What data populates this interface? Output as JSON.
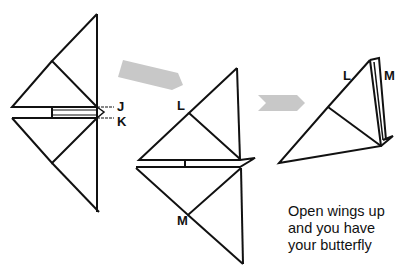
{
  "diagram": {
    "type": "origami-instruction",
    "subject": "butterfly",
    "steps": [
      {
        "id": "step-1",
        "labels": [
          "J",
          "K"
        ],
        "description": "Diamond with horizontal fold strip at center; creases J and K"
      },
      {
        "id": "step-2",
        "labels": [
          "L",
          "M"
        ],
        "description": "Folded along J/K; points L (upper) and M (lower)"
      },
      {
        "id": "step-3",
        "labels": [
          "L",
          "M"
        ],
        "description": "Folded in half; L in front, M behind"
      }
    ],
    "arrows": [
      {
        "id": "arrow-1",
        "from": "step-1",
        "to": "step-2",
        "color": "#c8c8c8"
      },
      {
        "id": "arrow-2",
        "from": "step-2",
        "to": "step-3",
        "color": "#c8c8c8"
      }
    ],
    "caption": {
      "line1": "Open wings up",
      "line2": "and you have",
      "line3": "your butterfly"
    },
    "colors": {
      "line": "#111111",
      "arrow": "#c8c8c8",
      "background": "#ffffff"
    }
  },
  "labels": {
    "J": "J",
    "K": "K",
    "L2": "L",
    "M2": "M",
    "L3": "L",
    "M3": "M"
  }
}
